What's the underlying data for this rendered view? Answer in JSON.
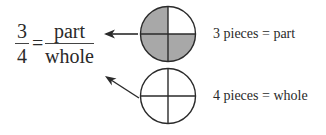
{
  "equation": {
    "left_numerator": "3",
    "left_denominator": "4",
    "equals": "=",
    "right_numerator": "part",
    "right_denominator": "whole"
  },
  "circles": [
    {
      "id": "part-circle",
      "pieces_total": 4,
      "pieces_shaded": 3,
      "shade_color": "#a8a8a8",
      "label": "3 pieces = part"
    },
    {
      "id": "whole-circle",
      "pieces_total": 4,
      "pieces_shaded": 0,
      "shade_color": "#ffffff",
      "label": "4 pieces = whole"
    }
  ],
  "colors": {
    "stroke": "#2a2a2a",
    "shade": "#a8a8a8",
    "background": "#ffffff"
  }
}
